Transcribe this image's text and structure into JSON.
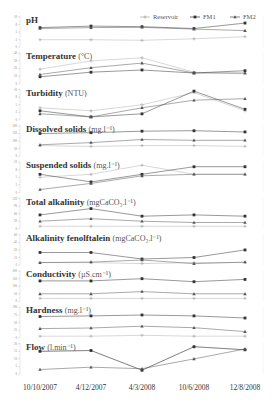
{
  "chart_data": {
    "type": "line",
    "layout": "10 stacked small-multiple line panels sharing x axis",
    "x": [
      "10/10/2007",
      "4/12/2007",
      "4/3/2008",
      "10/6/2008",
      "12/8/2008"
    ],
    "legend": {
      "position": "top-right",
      "entries": [
        {
          "name": "Reservoir",
          "marker": "plus",
          "color": "#aaaaaa"
        },
        {
          "name": "FM1",
          "marker": "square",
          "color": "#333333"
        },
        {
          "name": "FM2",
          "marker": "triangle",
          "color": "#555555"
        }
      ]
    },
    "panels": [
      {
        "title": "pH",
        "unit": "",
        "ylim": [
          0,
          10
        ],
        "series": [
          {
            "name": "Reservoir",
            "values": [
              2.5,
              2.5,
              2.3,
              2.8,
              3.5
            ]
          },
          {
            "name": "FM1",
            "values": [
              6.5,
              7.0,
              6.8,
              6.2,
              8.0
            ]
          },
          {
            "name": "FM2",
            "values": [
              6.2,
              6.5,
              6.6,
              6.0,
              5.5
            ]
          }
        ]
      },
      {
        "title": "Temperature",
        "unit": "(°C)",
        "ylim": [
          0,
          40
        ],
        "series": [
          {
            "name": "Reservoir",
            "values": [
              19,
              30,
              34,
              15,
              13
            ]
          },
          {
            "name": "FM1",
            "values": [
              9,
              15,
              18,
              14,
              17
            ]
          },
          {
            "name": "FM2",
            "values": [
              12,
              21,
              27,
              14,
              14
            ]
          }
        ]
      },
      {
        "title": "Turbidity",
        "unit": "(NTU)",
        "ylim": [
          0,
          10
        ],
        "series": [
          {
            "name": "Reservoir",
            "values": [
              4,
              3,
              5,
              9,
              3
            ]
          },
          {
            "name": "FM1",
            "values": [
              3,
              1,
              2,
              9.5,
              3.5
            ]
          },
          {
            "name": "FM2",
            "values": [
              2,
              1,
              4,
              6.5,
              7
            ]
          }
        ]
      },
      {
        "title": "Dissolved solids",
        "unit": "(mg.l⁻¹)",
        "ylim": [
          0,
          200
        ],
        "series": [
          {
            "name": "Reservoir",
            "values": [
              70,
              65,
              70,
              70,
              65
            ]
          },
          {
            "name": "FM1",
            "values": [
              150,
              155,
              165,
              168,
              160
            ]
          },
          {
            "name": "FM2",
            "values": [
              75,
              90,
              110,
              105,
              105
            ]
          }
        ]
      },
      {
        "title": "Suspended solids",
        "unit": "(mg.l⁻¹)",
        "ylim": [
          0,
          10
        ],
        "series": [
          {
            "name": "Reservoir",
            "values": [
              5,
              6,
              9,
              6,
              6
            ]
          },
          {
            "name": "FM1",
            "values": [
              6,
              3.5,
              6,
              8.5,
              8.5
            ]
          },
          {
            "name": "FM2",
            "values": [
              1,
              3,
              5.5,
              6,
              6
            ]
          }
        ]
      },
      {
        "title": "Total alkalinity",
        "unit": "(mgCaCO₃.l⁻¹)",
        "ylim": [
          0,
          120
        ],
        "series": [
          {
            "name": "Reservoir",
            "values": [
              10,
              10,
              10,
              10,
              10
            ]
          },
          {
            "name": "FM1",
            "values": [
              55,
              80,
              50,
              55,
              50
            ]
          },
          {
            "name": "FM2",
            "values": [
              30,
              40,
              30,
              25,
              25
            ]
          }
        ]
      },
      {
        "title": "Alkalinity fenolftalein",
        "unit": "(mgCaCO₃.l⁻¹)",
        "ylim": [
          0,
          60
        ],
        "series": [
          {
            "name": "Reservoir",
            "values": [
              5,
              5,
              3,
              5,
              5
            ]
          },
          {
            "name": "FM1",
            "values": [
              25,
              25,
              12,
              15,
              30
            ]
          },
          {
            "name": "FM2",
            "values": [
              5,
              6,
              10,
              3,
              6
            ]
          }
        ]
      },
      {
        "title": "Conductivity",
        "unit": "(µS.cm⁻¹)",
        "ylim": [
          0,
          200
        ],
        "series": [
          {
            "name": "Reservoir",
            "values": [
              20,
              20,
              20,
              20,
              20
            ]
          },
          {
            "name": "FM1",
            "values": [
              135,
              135,
              150,
              130,
              145
            ]
          },
          {
            "name": "FM2",
            "values": [
              50,
              50,
              65,
              50,
              50
            ]
          }
        ]
      },
      {
        "title": "Hardness",
        "unit": "(mg.l⁻¹)",
        "ylim": [
          0,
          100
        ],
        "series": [
          {
            "name": "Reservoir",
            "values": [
              5,
              5,
              8,
              5,
              5
            ]
          },
          {
            "name": "FM1",
            "values": [
              70,
              72,
              75,
              72,
              65
            ]
          },
          {
            "name": "FM2",
            "values": [
              30,
              32,
              38,
              33,
              20
            ]
          }
        ]
      },
      {
        "title": "Flow",
        "unit": "(l.min⁻¹)",
        "ylim": [
          0,
          20
        ],
        "series": [
          {
            "name": "Reservoir",
            "values": [
              15,
              15.5,
              2.5,
              18,
              16
            ]
          },
          {
            "name": "FM1",
            "values": [
              15,
              15.5,
              2.5,
              18,
              16
            ]
          },
          {
            "name": "FM2",
            "values": [
              3,
              4.5,
              3.5,
              10,
              16.5
            ]
          }
        ]
      }
    ]
  }
}
